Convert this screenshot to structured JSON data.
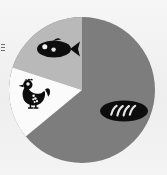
{
  "figure": {
    "width": 167,
    "height": 175,
    "background_color": "#f1f1f1"
  },
  "chart_data": {
    "type": "pie",
    "title": "",
    "subtitle": "",
    "xlabel": "",
    "ylabel": "",
    "grid": false,
    "legend_position": "none",
    "labels_shown": "icons-only",
    "center": {
      "x": 82,
      "y": 90
    },
    "radius": 73,
    "start_angle_deg": 270,
    "direction": "counterclockwise",
    "categories": [
      "Fish",
      "Poultry",
      "Bread"
    ],
    "values": [
      20,
      16,
      64
    ],
    "units": "percent",
    "total": 100,
    "slices": [
      {
        "label": "Fish",
        "value": 20,
        "color": "#b9b9b9",
        "icon": "fish-icon",
        "start_angle_deg": 270,
        "end_angle_deg": 198,
        "icon_center": {
          "x": 57,
          "y": 49
        }
      },
      {
        "label": "Poultry",
        "value": 16,
        "color": "#fbfbfb",
        "icon": "chicken-icon",
        "start_angle_deg": 198,
        "end_angle_deg": 140,
        "icon_center": {
          "x": 32,
          "y": 94
        }
      },
      {
        "label": "Bread",
        "value": 64,
        "color": "#7d7d7d",
        "icon": "bread-icon",
        "start_angle_deg": 140,
        "end_angle_deg": 270,
        "icon_center": {
          "x": 124,
          "y": 111
        }
      }
    ]
  },
  "colors": {
    "slice_fish": "#b9b9b9",
    "slice_poultry": "#fbfbfb",
    "slice_bread": "#7d7d7d",
    "icon_fill": "#111111",
    "icon_detail": "#f4f4f4",
    "page_background": "#f1f1f1"
  },
  "icons": {
    "fish": "fish-icon",
    "chicken": "chicken-icon",
    "bread": "bread-icon"
  },
  "edge_marks": {
    "count": 3,
    "description": "cropped marginal tick marks"
  }
}
